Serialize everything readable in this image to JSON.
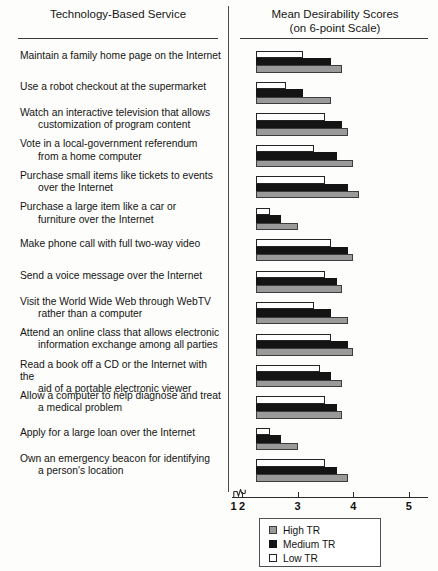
{
  "headers": {
    "left": "Technology-Based Service",
    "right_line1": "Mean Desirability Scores",
    "right_line2": "(on 6-point Scale)"
  },
  "legend": {
    "title": "",
    "items": [
      {
        "label": "High TR",
        "key": "high",
        "color": "#9a9a9a"
      },
      {
        "label": "Medium TR",
        "key": "med",
        "color": "#141414"
      },
      {
        "label": "Low TR",
        "key": "low",
        "color": "#ffffff"
      }
    ]
  },
  "axis": {
    "ticks": [
      "1",
      "2",
      "3",
      "4",
      "5"
    ],
    "broken_between": [
      "1",
      "2"
    ],
    "min": 2,
    "max": 5
  },
  "chart_data": {
    "type": "bar",
    "orientation": "horizontal",
    "title": "Mean Desirability Scores (on 6-point Scale)",
    "xlabel": "Mean Desirability Scores (on 6-point Scale)",
    "ylabel": "Technology-Based Service",
    "xlim": [
      2,
      5
    ],
    "xticks": [
      1,
      2,
      3,
      4,
      5
    ],
    "axis_break": "between 1 and 2",
    "grid": false,
    "legend_position": "bottom-center",
    "categories": [
      "Maintain a family home page on the Internet",
      "Use a robot checkout at the supermarket",
      "Watch an interactive television that allows customization of program content",
      "Vote in a local-government referendum from a home computer",
      "Purchase small items like tickets to events over the Internet",
      "Purchase a large item like a car or furniture over the Internet",
      "Make phone call with full two-way video",
      "Send a voice message over the Internet",
      "Visit the World Wide Web through WebTV rather than a computer",
      "Attend an online class that allows electronic information exchange among all parties",
      "Read a book off a CD or the Internet with the aid of a portable electronic viewer",
      "Allow a computer to help diagnose and treat a medical problem",
      "Apply for a large loan over the Internet",
      "Own an emergency beacon for identifying a person's location"
    ],
    "series": [
      {
        "name": "Low TR",
        "key": "low",
        "values": [
          3.1,
          2.8,
          3.5,
          3.3,
          3.5,
          2.5,
          3.6,
          3.5,
          3.3,
          3.6,
          3.4,
          3.5,
          2.5,
          3.5
        ]
      },
      {
        "name": "Medium TR",
        "key": "med",
        "values": [
          3.6,
          3.1,
          3.8,
          3.7,
          3.9,
          2.7,
          3.9,
          3.7,
          3.6,
          3.9,
          3.6,
          3.7,
          2.7,
          3.7
        ]
      },
      {
        "name": "High TR",
        "key": "high",
        "values": [
          3.8,
          3.6,
          3.9,
          4.0,
          4.1,
          3.0,
          4.0,
          3.8,
          3.9,
          4.0,
          3.8,
          3.8,
          3.0,
          3.9
        ]
      }
    ]
  },
  "rows": [
    {
      "line1": "Maintain a family home page on the Internet",
      "line2": ""
    },
    {
      "line1": "Use a robot checkout at the supermarket",
      "line2": ""
    },
    {
      "line1": "Watch an interactive television that allows",
      "line2": "customization of program content"
    },
    {
      "line1": "Vote in a local-government referendum",
      "line2": "from a home computer"
    },
    {
      "line1": "Purchase small items like tickets to events",
      "line2": "over the Internet"
    },
    {
      "line1": "Purchase a large item like a car or",
      "line2": "furniture over the Internet"
    },
    {
      "line1": "Make phone call with full two-way video",
      "line2": ""
    },
    {
      "line1": "Send a voice message over the Internet",
      "line2": ""
    },
    {
      "line1": "Visit the World Wide Web through WebTV",
      "line2": "rather than a computer"
    },
    {
      "line1": "Attend an online class that allows electronic",
      "line2": "information exchange among all parties"
    },
    {
      "line1": "Read a book off a CD or the Internet with the",
      "line2": "aid of a portable electronic viewer"
    },
    {
      "line1": "Allow a computer to help diagnose and treat",
      "line2": "a medical problem"
    },
    {
      "line1": "Apply for a large loan over the Internet",
      "line2": ""
    },
    {
      "line1": "Own an emergency beacon for identifying",
      "line2": "a person's location"
    }
  ]
}
